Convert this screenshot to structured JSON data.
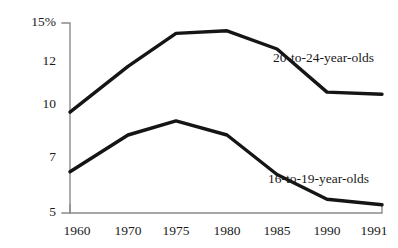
{
  "chart_data": {
    "type": "line",
    "title": "",
    "subtitle": "",
    "xlabel": "",
    "ylabel": "",
    "grid": false,
    "legend_position": "inline-right",
    "x": [
      "1960",
      "1970",
      "1975",
      "1980",
      "1985",
      "1990",
      "1991"
    ],
    "categories": [
      "1960",
      "1970",
      "1975",
      "1980",
      "1985",
      "1990",
      "1991"
    ],
    "ytick_labels": [
      "15%",
      "12",
      "10",
      "7",
      "5"
    ],
    "ytick_values": [
      15,
      12,
      10,
      7,
      5
    ],
    "ylim": [
      5,
      15
    ],
    "series": [
      {
        "name": "20-to-24-year-olds",
        "label": "20-to-24-year-olds",
        "values": [
          9.6,
          11.8,
          14.2,
          14.4,
          13.0,
          10.6,
          10.5
        ]
      },
      {
        "name": "16-to-19-year-olds",
        "label": "16-to-19-year-olds",
        "values": [
          6.5,
          8.3,
          9.1,
          8.3,
          6.4,
          5.5,
          5.3
        ]
      }
    ],
    "colors": {
      "line": "#151515",
      "axis": "#8a8a8a",
      "background": "#ffffff",
      "text": "#1a1a1a"
    }
  },
  "axis": {
    "y_labels": [
      {
        "text": "15%",
        "y": 23
      },
      {
        "text": "12",
        "y": 62
      },
      {
        "text": "10",
        "y": 105
      },
      {
        "text": "7",
        "y": 158
      },
      {
        "text": "5",
        "y": 213
      }
    ],
    "x_labels": [
      {
        "text": "1960",
        "x": 77
      },
      {
        "text": "1970",
        "x": 128
      },
      {
        "text": "1975",
        "x": 176
      },
      {
        "text": "1980",
        "x": 227
      },
      {
        "text": "1985",
        "x": 277
      },
      {
        "text": "1990",
        "x": 327
      },
      {
        "text": "1991",
        "x": 374
      }
    ]
  },
  "annotations": {
    "upper_label": {
      "text": "20-to-24-year-olds",
      "x": 273,
      "y": 57
    },
    "lower_label": {
      "text": "16-to-19-year-olds",
      "x": 268,
      "y": 178
    }
  },
  "geometry": {
    "y_axis_x": 70,
    "y_axis_top": 23,
    "y_axis_bottom": 213,
    "x_axis_y": 213,
    "x_axis_left": 70,
    "x_axis_right": 382,
    "upper_points": "70,124 128,72 176,33 227,31 277,55 327,98 382,100",
    "lower_points": "70,167 128,142 176,128 227,142 277,177 327,196 382,202"
  }
}
